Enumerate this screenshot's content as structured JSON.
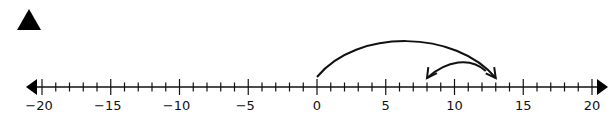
{
  "marker": {
    "shape": "triangle",
    "color": "#000000"
  },
  "number_line": {
    "min": -20,
    "max": 20,
    "minor_step": 1,
    "major_step": 5,
    "labels": [
      "−20",
      "−15",
      "−10",
      "−5",
      "0",
      "5",
      "10",
      "15",
      "20"
    ],
    "label_values": [
      -20,
      -15,
      -10,
      -5,
      0,
      5,
      10,
      15,
      20
    ],
    "color": "#111111"
  },
  "jumps": [
    {
      "from": 0,
      "to": 13,
      "direction": "right",
      "name": "jump-right-13"
    },
    {
      "from": 13,
      "to": 8,
      "direction": "left",
      "name": "jump-left-5"
    }
  ]
}
